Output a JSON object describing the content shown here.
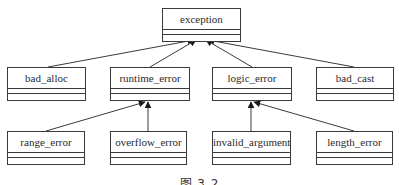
{
  "diagram": {
    "type": "uml-class-hierarchy",
    "root": {
      "id": "exception",
      "label": "exception"
    },
    "level1": [
      {
        "id": "bad_alloc",
        "label": "bad_alloc",
        "parent": "exception"
      },
      {
        "id": "runtime_error",
        "label": "runtime_error",
        "parent": "exception"
      },
      {
        "id": "logic_error",
        "label": "logic_error",
        "parent": "exception"
      },
      {
        "id": "bad_cast",
        "label": "bad_cast",
        "parent": "exception"
      }
    ],
    "level2": [
      {
        "id": "range_error",
        "label": "range_error",
        "parent": "runtime_error"
      },
      {
        "id": "overflow_error",
        "label": "overflow_error",
        "parent": "runtime_error"
      },
      {
        "id": "invalid_argument",
        "label": "invalid_argument",
        "parent": "logic_error"
      },
      {
        "id": "length_error",
        "label": "length_error",
        "parent": "logic_error"
      }
    ],
    "edges": [
      {
        "from": "bad_alloc",
        "to": "exception"
      },
      {
        "from": "runtime_error",
        "to": "exception"
      },
      {
        "from": "logic_error",
        "to": "exception"
      },
      {
        "from": "bad_cast",
        "to": "exception"
      },
      {
        "from": "range_error",
        "to": "runtime_error"
      },
      {
        "from": "overflow_error",
        "to": "runtime_error"
      },
      {
        "from": "invalid_argument",
        "to": "logic_error"
      },
      {
        "from": "length_error",
        "to": "logic_error"
      }
    ],
    "caption": "图 3.2",
    "colors": {
      "line": "#3a3a3a",
      "background": "#ffffff",
      "text": "#2a2a2a"
    }
  }
}
